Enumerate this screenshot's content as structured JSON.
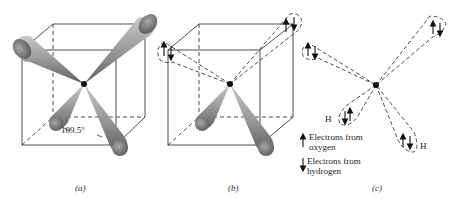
{
  "figure": {
    "panels": [
      {
        "id": "a",
        "caption": "(a)",
        "angle_label": "109.5°"
      },
      {
        "id": "b",
        "caption": "(b)"
      },
      {
        "id": "c",
        "caption": "(c)",
        "hydrogen_labels": [
          "H",
          "H"
        ]
      }
    ],
    "legend": {
      "oxygen": "Electrons from oxygen",
      "oxygen_line1": "Electrons from",
      "oxygen_line2": "oxygen",
      "hydrogen_line1": "Electrons from",
      "hydrogen_line2": "hydrogen"
    },
    "colors": {
      "lobe_fill": "#9a9a9a",
      "lobe_dark": "#666666",
      "line": "#222222"
    }
  }
}
